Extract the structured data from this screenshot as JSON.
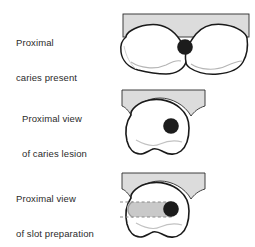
{
  "figure": {
    "type": "dental-illustration",
    "background_color": "#ffffff",
    "outline_color": "#1a1a1a",
    "tooth_fill": "#ffffff",
    "adjacent_tooth_fill": "#dcdcdc",
    "caries_fill": "#1c1c1c",
    "slot_fill": "#c9c9c9",
    "dash_color": "#8a8a8a",
    "shadow_color": "#cfcfcf"
  },
  "panels": [
    {
      "id": "panel-occlusal",
      "caption_lines": [
        "Proximal",
        "caries present"
      ],
      "view": "occlusal view of two adjacent teeth",
      "elements": [
        "adjacent-tooth-band",
        "tooth-left",
        "tooth-right",
        "caries-lesion"
      ]
    },
    {
      "id": "panel-proximal-caries",
      "caption_lines": [
        "Proximal view",
        "of caries lesion"
      ],
      "view": "proximal view of single tooth",
      "elements": [
        "adjacent-tooth-band",
        "tooth-body",
        "caries-lesion"
      ]
    },
    {
      "id": "panel-proximal-slot",
      "caption_lines": [
        "Proximal view",
        "of slot preparation"
      ],
      "view": "proximal view of single tooth with slot preparation",
      "elements": [
        "adjacent-tooth-band",
        "tooth-body",
        "slot-preparation",
        "caries-lesion"
      ]
    }
  ]
}
